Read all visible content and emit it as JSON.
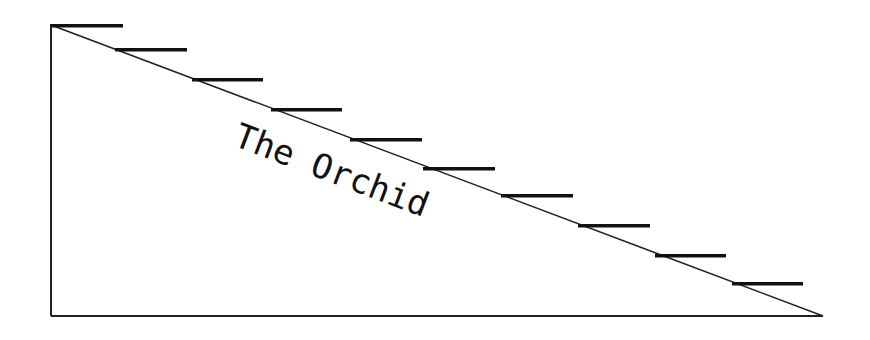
{
  "diagram": {
    "title": "The Orchid",
    "colors": {
      "line": "#222222",
      "bar": "#111111",
      "text": "#111111",
      "background": "#ffffff"
    },
    "frame": {
      "left_x": 51,
      "top_y": 24,
      "baseline_y": 316,
      "right_x": 823
    },
    "steps": [
      {
        "x": 51,
        "y": 24,
        "w": 72
      },
      {
        "x": 115,
        "y": 48,
        "w": 72
      },
      {
        "x": 192,
        "y": 78,
        "w": 71
      },
      {
        "x": 271,
        "y": 108,
        "w": 71
      },
      {
        "x": 350,
        "y": 138,
        "w": 72
      },
      {
        "x": 423,
        "y": 167,
        "w": 72
      },
      {
        "x": 501,
        "y": 194,
        "w": 72
      },
      {
        "x": 578,
        "y": 224,
        "w": 72
      },
      {
        "x": 655,
        "y": 254,
        "w": 71
      },
      {
        "x": 732,
        "y": 282,
        "w": 71
      }
    ],
    "label": {
      "x": 232,
      "y": 145,
      "rotation_deg": 20.7
    }
  }
}
